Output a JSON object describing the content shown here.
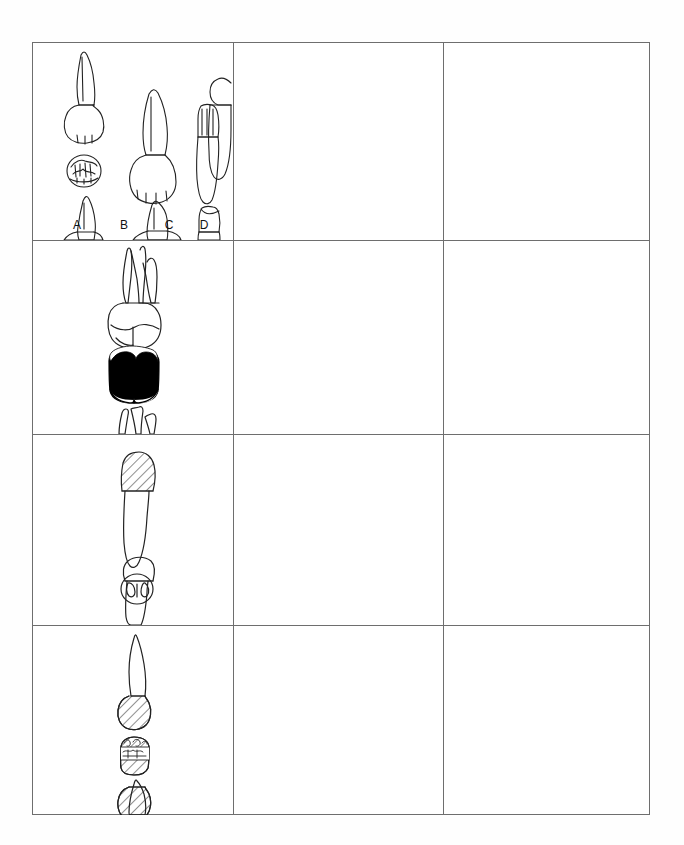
{
  "figure": {
    "background_color": "#fefefe",
    "table": {
      "border_color": "#6e6e6e",
      "x": 32,
      "y": 42,
      "width": 618,
      "height": 773,
      "columns": 3,
      "rows": 4,
      "column_dividers_x": [
        233,
        443
      ],
      "row_dividers_y": [
        240,
        434,
        625
      ],
      "cells": [
        {
          "row": 1,
          "col": 1,
          "content_type": "tooth-illustrations",
          "empty": false,
          "description": "Four anterior teeth shown in two rows of labial and proximal views with an occlusal/incisal view inset",
          "view_labels": [
            "A",
            "B",
            "C",
            "D"
          ],
          "teeth": [
            {
              "label": "A",
              "name": "maxillary-central-incisor",
              "views": [
                "labial",
                "incisal",
                "proximal"
              ],
              "fill": "none"
            },
            {
              "label": "B",
              "name": "maxillary-lateral-incisor",
              "views": [
                "labial",
                "proximal"
              ],
              "fill": "none"
            },
            {
              "label": "C",
              "name": "mandibular-central-incisor",
              "views": [
                "labial",
                "proximal"
              ],
              "fill": "none"
            },
            {
              "label": "D",
              "name": "mandibular-lateral-incisor",
              "views": [
                "labial",
                "proximal"
              ],
              "fill": "none"
            }
          ]
        },
        {
          "row": 1,
          "col": 2,
          "content_type": "blank",
          "empty": true
        },
        {
          "row": 1,
          "col": 3,
          "content_type": "blank",
          "empty": true
        },
        {
          "row": 2,
          "col": 1,
          "content_type": "tooth-illustrations",
          "empty": false,
          "description": "Maxillary molar with three roots, buccal view, occlusal view filled solid black, and lingual view",
          "teeth": [
            {
              "name": "maxillary-first-molar",
              "views": [
                "buccal",
                "occlusal",
                "lingual"
              ],
              "fill": "black-occlusal"
            }
          ]
        },
        {
          "row": 2,
          "col": 2,
          "content_type": "blank",
          "empty": true
        },
        {
          "row": 2,
          "col": 3,
          "content_type": "blank",
          "empty": true
        },
        {
          "row": 3,
          "col": 1,
          "content_type": "tooth-illustrations",
          "empty": false,
          "description": "Premolar with diagonally hatched crown, small occlusal view, and plain crown view",
          "teeth": [
            {
              "name": "mandibular-premolar",
              "views": [
                "buccal-hatched",
                "occlusal",
                "lingual"
              ],
              "fill": "diagonal-hatch"
            }
          ]
        },
        {
          "row": 3,
          "col": 2,
          "content_type": "blank",
          "empty": true
        },
        {
          "row": 3,
          "col": 3,
          "content_type": "blank",
          "empty": true
        },
        {
          "row": 4,
          "col": 1,
          "content_type": "tooth-illustrations",
          "empty": false,
          "description": "Anterior tooth with diagonally hatched crown, hatched occlusal view, and second hatched crown view",
          "teeth": [
            {
              "name": "anterior-tooth-restored",
              "views": [
                "labial-hatched",
                "incisal-hatched",
                "labial-hatched"
              ],
              "fill": "diagonal-hatch"
            }
          ]
        },
        {
          "row": 4,
          "col": 2,
          "content_type": "blank",
          "empty": true
        },
        {
          "row": 4,
          "col": 3,
          "content_type": "blank",
          "empty": true
        }
      ]
    },
    "labels": {
      "a": "A",
      "b": "B",
      "c": "C",
      "d": "D"
    },
    "colors": {
      "line": "#222222",
      "border": "#6e6e6e",
      "fill_black": "#000000",
      "paper": "#fefefe"
    }
  }
}
